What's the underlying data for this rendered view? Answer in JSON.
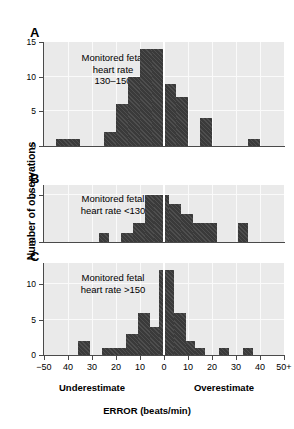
{
  "chart_data": {
    "type": "bar",
    "title": "",
    "subtitle": "",
    "xlabel": "ERROR (beats/min)",
    "ylabel": "Number of observations",
    "grid": true,
    "legend_position": "none",
    "bin_width": 5,
    "x_tick_labels": [
      "−50",
      "40",
      "30",
      "20",
      "10",
      "0",
      "10",
      "20",
      "30",
      "40",
      "50+"
    ],
    "x_tick_values": [
      -50,
      -40,
      -30,
      -20,
      -10,
      0,
      10,
      20,
      30,
      40,
      50
    ],
    "xlim": [
      -50,
      50
    ],
    "left_caption": "Underestimate",
    "right_caption": "Overestimate",
    "zero_reference_line": true,
    "panels": [
      {
        "letter": "A",
        "note": "Monitored fetal\nheart rate\n130–150",
        "note_line1": "Monitored fetal",
        "note_line2": "heart rate",
        "note_line3": "130–150",
        "ylim": [
          0,
          15
        ],
        "y_tick_labels": [
          "0",
          "5",
          "10",
          "15"
        ],
        "y_tick_values": [
          0,
          5,
          10,
          15
        ],
        "bins": [
          {
            "x0": -45,
            "x1": -35,
            "value": 1
          },
          {
            "x0": -25,
            "x1": -20,
            "value": 2
          },
          {
            "x0": -20,
            "x1": -15,
            "value": 6
          },
          {
            "x0": -15,
            "x1": -10,
            "value": 10
          },
          {
            "x0": -10,
            "x1": -5,
            "value": 14
          },
          {
            "x0": -5,
            "x1": 0,
            "value": 14
          },
          {
            "x0": 0,
            "x1": 5,
            "value": 9
          },
          {
            "x0": 5,
            "x1": 10,
            "value": 7
          },
          {
            "x0": 15,
            "x1": 20,
            "value": 4
          },
          {
            "x0": 35,
            "x1": 40,
            "value": 1
          }
        ]
      },
      {
        "letter": "B",
        "note": "Monitored fetal\nheart rate <130",
        "note_line1": "Monitored fetal",
        "note_line2": "heart rate <130",
        "note_line3": "",
        "ylim": [
          0,
          6
        ],
        "y_tick_labels": [
          "0",
          "5"
        ],
        "y_tick_values": [
          0,
          5
        ],
        "bins": [
          {
            "x0": -27,
            "x1": -23,
            "value": 1
          },
          {
            "x0": -18,
            "x1": -13,
            "value": 1
          },
          {
            "x0": -13,
            "x1": -8,
            "value": 2
          },
          {
            "x0": -8,
            "x1": -4,
            "value": 5
          },
          {
            "x0": -4,
            "x1": 2,
            "value": 5
          },
          {
            "x0": 2,
            "x1": 7,
            "value": 4
          },
          {
            "x0": 7,
            "x1": 12,
            "value": 3
          },
          {
            "x0": 12,
            "x1": 22,
            "value": 2
          },
          {
            "x0": 31,
            "x1": 35,
            "value": 2
          }
        ]
      },
      {
        "letter": "C",
        "note": "Monitored fetal\nheart rate >150",
        "note_line1": "Monitored fetal",
        "note_line2": "heart rate >150",
        "note_line3": "",
        "ylim": [
          0,
          13
        ],
        "y_tick_labels": [
          "0",
          "5",
          "10"
        ],
        "y_tick_values": [
          0,
          5,
          10
        ],
        "bins": [
          {
            "x0": -36,
            "x1": -31,
            "value": 2
          },
          {
            "x0": -26,
            "x1": -16,
            "value": 1
          },
          {
            "x0": -16,
            "x1": -11,
            "value": 3
          },
          {
            "x0": -11,
            "x1": -6,
            "value": 6
          },
          {
            "x0": -6,
            "x1": -2,
            "value": 4
          },
          {
            "x0": -2,
            "x1": 0,
            "value": 12
          },
          {
            "x0": 0,
            "x1": 4,
            "value": 12
          },
          {
            "x0": 4,
            "x1": 9,
            "value": 6
          },
          {
            "x0": 9,
            "x1": 13,
            "value": 2
          },
          {
            "x0": 13,
            "x1": 17,
            "value": 1
          },
          {
            "x0": 23,
            "x1": 27,
            "value": 1
          },
          {
            "x0": 33,
            "x1": 37,
            "value": 1
          }
        ]
      }
    ]
  },
  "colors": {
    "bar": "#3a3a3a",
    "plot_background": "#eaeaea",
    "gridline": "#fafafa",
    "axis": "#4a4a4a",
    "text": "#000000",
    "page_background": "#ffffff"
  }
}
